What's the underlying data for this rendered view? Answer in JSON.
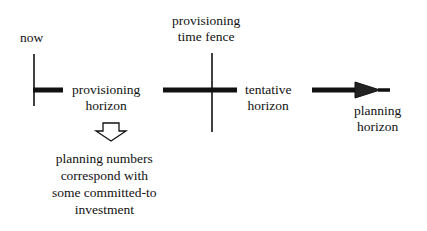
{
  "diagram": {
    "labels": {
      "now": "now",
      "provisioning_time_fence": [
        "provisioning",
        "time fence"
      ],
      "provisioning_horizon": [
        "provisioning",
        "horizon"
      ],
      "tentative_horizon": [
        "tentative",
        "horizon"
      ],
      "planning_horizon": [
        "planning",
        "horizon"
      ],
      "note": [
        "planning numbers",
        "correspond with",
        "some committed-to",
        "investment"
      ]
    },
    "colors": {
      "line": "#111111",
      "background": "#ffffff",
      "arrow_fill": "#ffffff"
    }
  }
}
